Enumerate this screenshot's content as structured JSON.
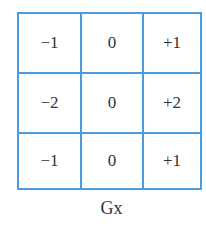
{
  "kernel": {
    "rows": [
      [
        "−1",
        "0",
        "+1"
      ],
      [
        "−2",
        "0",
        "+2"
      ],
      [
        "−1",
        "0",
        "+1"
      ]
    ]
  },
  "caption": "Gx",
  "colors": {
    "grid_line": "#4a9be0"
  }
}
